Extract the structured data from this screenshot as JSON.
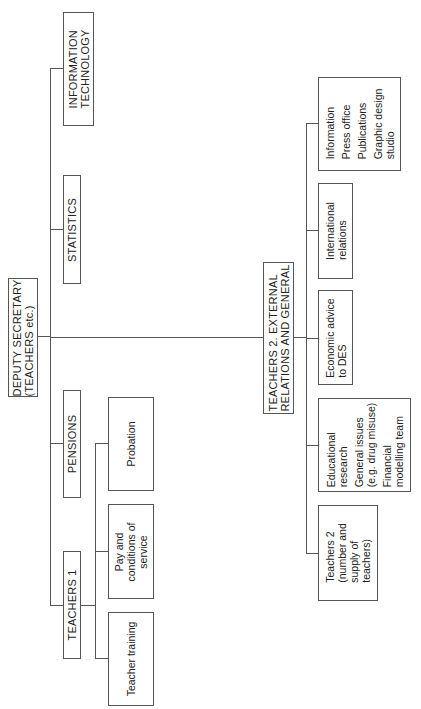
{
  "chart": {
    "root": {
      "label_line1": "DEPUTY SECRETARY",
      "label_line2": "(TEACHERS etc.)"
    },
    "branches": [
      {
        "key": "it",
        "line1": "INFORMATION",
        "line2": "TECHNOLOGY"
      },
      {
        "key": "statistics",
        "line1": "STATISTICS"
      },
      {
        "key": "pensions",
        "line1": "PENSIONS"
      },
      {
        "key": "teachers1",
        "line1": "TEACHERS 1",
        "children": [
          {
            "lines": [
              "Probation"
            ]
          },
          {
            "lines": [
              "Pay and",
              "conditions of",
              "service"
            ]
          },
          {
            "lines": [
              "Teacher training"
            ]
          }
        ]
      },
      {
        "key": "teachers2",
        "line1": "TEACHERS 2. EXTERNAL",
        "line2": "RELATIONS AND GENERAL",
        "children": [
          {
            "lines": [
              "Information",
              "Press office",
              "Publications",
              "Graphic design",
              "studio"
            ]
          },
          {
            "lines": [
              "International",
              "relations"
            ]
          },
          {
            "lines": [
              "Economic advice",
              "to DES"
            ]
          },
          {
            "lines": [
              "Educational",
              "research",
              "General issues",
              "(e.g. drug misuse)",
              "Financial",
              "modelling team"
            ]
          },
          {
            "lines": [
              "Teachers 2",
              "(number and",
              "supply of",
              "teachers)"
            ]
          }
        ]
      }
    ]
  }
}
